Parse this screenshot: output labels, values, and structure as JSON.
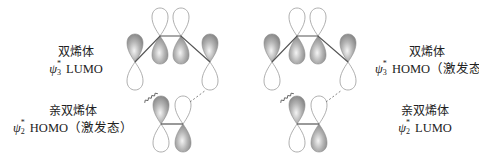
{
  "left_panel": {
    "diene": {
      "name": "双烯体",
      "orbital_symbol": "ψ",
      "orbital_sup": "*",
      "orbital_sub": "3",
      "orbital_type": "LUMO",
      "state_note": ""
    },
    "dienophile": {
      "name": "亲双烯体",
      "orbital_symbol": "ψ",
      "orbital_sup": "*",
      "orbital_sub": "2",
      "orbital_type": "HOMO",
      "state_note": "（激发态）"
    }
  },
  "right_panel": {
    "diene": {
      "name": "双烯体",
      "orbital_symbol": "ψ",
      "orbital_sup": "*",
      "orbital_sub": "3",
      "orbital_type": "HOMO",
      "state_note": "（激发态）"
    },
    "dienophile": {
      "name": "亲双烯体",
      "orbital_symbol": "ψ",
      "orbital_sup": "*",
      "orbital_sub": "2",
      "orbital_type": "LUMO",
      "state_note": ""
    }
  },
  "colors": {
    "lobe_shaded": "#9a9a9a",
    "lobe_outline": "#8c8c8c",
    "bond": "#555555",
    "background": "#ffffff"
  },
  "interactions": {
    "bonding_marker": "wavy-line",
    "antibonding_marker": "dashed-line"
  }
}
